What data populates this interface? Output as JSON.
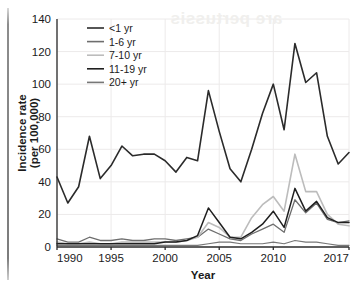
{
  "figure": {
    "background_color": "#ffffff",
    "gutter_artifact": true,
    "watermark_text": "are pertussis"
  },
  "chart_data": {
    "type": "line",
    "title": "",
    "xlabel": "Year",
    "ylabel": "Incidence rate\n(per 100,000)",
    "ylabel_line1": "Incidence rate",
    "ylabel_line2": "(per 100,000)",
    "xlim": [
      1990,
      2017
    ],
    "ylim": [
      0,
      140
    ],
    "xticks": [
      1990,
      1995,
      2000,
      2005,
      2010,
      2017
    ],
    "xtick_labels": [
      "1990",
      "1995",
      "2000",
      "2005",
      "2010",
      "2017"
    ],
    "yticks": [
      0,
      20,
      40,
      60,
      80,
      100,
      120,
      140
    ],
    "ytick_labels": [
      "0",
      "20",
      "40",
      "60",
      "80",
      "100",
      "120",
      "140"
    ],
    "grid": true,
    "grid_axis": "y",
    "legend_position": "top-left",
    "x": [
      1990,
      1991,
      1992,
      1993,
      1994,
      1995,
      1996,
      1997,
      1998,
      1999,
      2000,
      2001,
      2002,
      2003,
      2004,
      2005,
      2006,
      2007,
      2008,
      2009,
      2010,
      2011,
      2012,
      2013,
      2014,
      2015,
      2016,
      2017
    ],
    "series": [
      {
        "name": "<1 yr",
        "color": "#2b2b2b",
        "width": 1.6,
        "values": [
          43,
          27,
          37,
          68,
          42,
          50,
          62,
          56,
          57,
          57,
          53,
          46,
          55,
          53,
          96,
          71,
          48,
          40,
          60,
          82,
          100,
          72,
          125,
          101,
          107,
          68,
          51,
          58
        ]
      },
      {
        "name": "1-6 yr",
        "color": "#6e6e6e",
        "width": 1.3,
        "values": [
          5,
          3,
          3,
          6,
          4,
          4,
          5,
          4,
          4,
          5,
          5,
          4,
          5,
          6,
          11,
          8,
          5,
          4,
          8,
          11,
          14,
          9,
          29,
          21,
          27,
          17,
          15,
          16
        ]
      },
      {
        "name": "7-10 yr",
        "color": "#bcbcbc",
        "width": 1.6,
        "values": [
          3,
          2,
          2,
          3,
          2,
          2,
          3,
          3,
          3,
          3,
          3,
          3,
          4,
          6,
          15,
          12,
          6,
          6,
          18,
          26,
          31,
          22,
          57,
          34,
          34,
          20,
          14,
          13
        ]
      },
      {
        "name": "11-19 yr",
        "color": "#1f1f1f",
        "width": 1.5,
        "values": [
          2,
          2,
          2,
          2,
          2,
          2,
          2,
          2,
          2,
          2,
          3,
          3,
          4,
          7,
          24,
          15,
          6,
          5,
          9,
          14,
          22,
          12,
          36,
          22,
          28,
          18,
          15,
          15
        ]
      },
      {
        "name": "20+ yr",
        "color": "#777777",
        "width": 1.2,
        "values": [
          1,
          1,
          1,
          1,
          1,
          1,
          1,
          1,
          1,
          1,
          1,
          1,
          1,
          1,
          2,
          3,
          3,
          2,
          2,
          2,
          3,
          2,
          4,
          3,
          3,
          2,
          1,
          1
        ]
      }
    ]
  }
}
